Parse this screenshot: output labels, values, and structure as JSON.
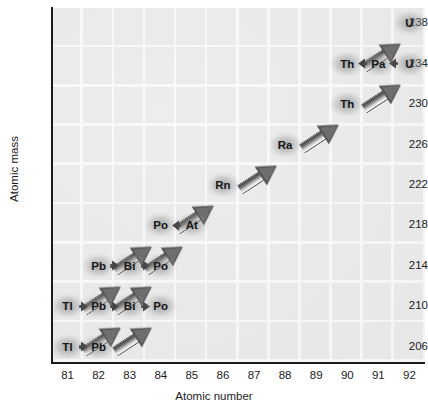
{
  "chart_data": {
    "type": "scatter",
    "title": "",
    "xlabel": "Atomic number",
    "ylabel": "Atomic mass",
    "xlim": [
      80.5,
      92.5
    ],
    "ylim": [
      204.5,
      239.5
    ],
    "xticks": [
      "81",
      "82",
      "83",
      "84",
      "85",
      "86",
      "87",
      "88",
      "89",
      "90",
      "91",
      "92"
    ],
    "yticks": [
      "206",
      "210",
      "214",
      "218",
      "222",
      "226",
      "230",
      "234",
      "238"
    ],
    "grid": true,
    "legend": "none",
    "nodes": [
      {
        "label": "U",
        "x": 92,
        "y": 238
      },
      {
        "label": "U",
        "x": 92,
        "y": 234
      },
      {
        "label": "Pa",
        "x": 91,
        "y": 234
      },
      {
        "label": "Th",
        "x": 90,
        "y": 234
      },
      {
        "label": "Th",
        "x": 90,
        "y": 230
      },
      {
        "label": "Ra",
        "x": 88,
        "y": 226
      },
      {
        "label": "Rn",
        "x": 86,
        "y": 222
      },
      {
        "label": "At",
        "x": 85,
        "y": 218
      },
      {
        "label": "Po",
        "x": 84,
        "y": 218
      },
      {
        "label": "Po",
        "x": 84,
        "y": 214
      },
      {
        "label": "Bi",
        "x": 83,
        "y": 214
      },
      {
        "label": "Pb",
        "x": 82,
        "y": 214
      },
      {
        "label": "Po",
        "x": 84,
        "y": 210
      },
      {
        "label": "Bi",
        "x": 83,
        "y": 210
      },
      {
        "label": "Pb",
        "x": 82,
        "y": 210
      },
      {
        "label": "Tl",
        "x": 81,
        "y": 210
      },
      {
        "label": "Pb",
        "x": 82,
        "y": 206
      },
      {
        "label": "Tl",
        "x": 81,
        "y": 206
      }
    ],
    "alpha_decays": [
      {
        "from": [
          92,
          238
        ],
        "to": [
          90,
          234
        ]
      },
      {
        "from": [
          92,
          234
        ],
        "to": [
          90,
          230
        ]
      },
      {
        "from": [
          90,
          230
        ],
        "to": [
          88,
          226
        ]
      },
      {
        "from": [
          88,
          226
        ],
        "to": [
          86,
          222
        ]
      },
      {
        "from": [
          86,
          222
        ],
        "to": [
          84,
          218
        ]
      },
      {
        "from": [
          85,
          218
        ],
        "to": [
          83,
          214
        ]
      },
      {
        "from": [
          84,
          218
        ],
        "to": [
          82,
          214
        ]
      },
      {
        "from": [
          84,
          214
        ],
        "to": [
          82,
          210
        ]
      },
      {
        "from": [
          83,
          214
        ],
        "to": [
          81,
          210
        ]
      },
      {
        "from": [
          84,
          210
        ],
        "to": [
          82,
          206
        ]
      },
      {
        "from": [
          83,
          210
        ],
        "to": [
          81,
          206
        ]
      }
    ],
    "beta_decays": [
      {
        "from": [
          92,
          234
        ],
        "to": [
          91,
          234
        ]
      },
      {
        "from": [
          91,
          234
        ],
        "to": [
          90,
          234
        ]
      },
      {
        "from": [
          85,
          218
        ],
        "to": [
          84,
          218
        ]
      },
      {
        "from": [
          82,
          214
        ],
        "to": [
          83,
          214
        ]
      },
      {
        "from": [
          83,
          214
        ],
        "to": [
          84,
          214
        ]
      },
      {
        "from": [
          81,
          210
        ],
        "to": [
          82,
          210
        ]
      },
      {
        "from": [
          82,
          210
        ],
        "to": [
          83,
          210
        ]
      },
      {
        "from": [
          83,
          210
        ],
        "to": [
          84,
          210
        ]
      },
      {
        "from": [
          81,
          206
        ],
        "to": [
          82,
          206
        ]
      }
    ]
  }
}
